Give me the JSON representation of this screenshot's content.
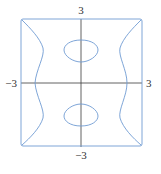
{
  "figure": {
    "type": "implicit-curve-plot",
    "domain": {
      "xmin": -3,
      "xmax": 3,
      "ymin": -3,
      "ymax": 3
    },
    "labels": {
      "top": "3",
      "bottom": "−3",
      "left": "−3",
      "right": "3"
    },
    "colors": {
      "curve": "#6f9bd3",
      "axis": "#3a3a3a",
      "label": "#333333"
    },
    "components": [
      {
        "name": "left-boundary-curve",
        "kind": "open-curve"
      },
      {
        "name": "right-boundary-curve",
        "kind": "open-curve"
      },
      {
        "name": "upper-closed-loop",
        "kind": "closed-curve"
      },
      {
        "name": "lower-closed-loop",
        "kind": "closed-curve"
      },
      {
        "name": "top-edge",
        "kind": "segment"
      },
      {
        "name": "bottom-edge",
        "kind": "segment"
      }
    ]
  }
}
